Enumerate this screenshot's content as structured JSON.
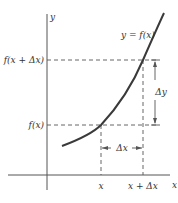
{
  "diagram": {
    "curve_label": "y = f(x)",
    "axes": {
      "x_axis_label": "x",
      "y_axis_label": "y"
    },
    "ticks": {
      "x_tick_1": "x",
      "x_tick_2": "x + Δx",
      "y_tick_1": "f(x)",
      "y_tick_2": "f(x + Δx)"
    },
    "annotations": {
      "delta_x": "Δx",
      "delta_y": "Δy"
    },
    "colors": {
      "curve": "#3a3a3a",
      "axes": "#555555",
      "dashed": "#555555",
      "text": "#333333"
    }
  }
}
